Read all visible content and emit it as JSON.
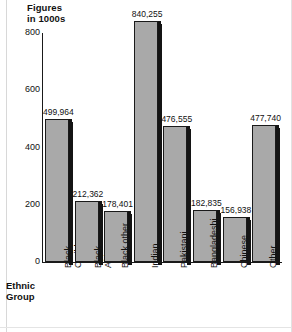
{
  "chart_data": {
    "type": "bar",
    "title": "",
    "ylabel": "Figures\nin 1000s",
    "xlabel": "Ethnic\nGroup",
    "ylim": [
      0,
      800
    ],
    "yticks": [
      0,
      200,
      400,
      600,
      800
    ],
    "grid": false,
    "legend": null,
    "categories": [
      "Black\nCaribbean",
      "Black\nAfrican",
      "Black other",
      "Indian",
      "Pakistani",
      "Bangladeshi",
      "Chinese",
      "Other"
    ],
    "values": [
      499964,
      212362,
      178401,
      840255,
      476555,
      182835,
      156938,
      477740
    ],
    "value_labels": [
      "499,964",
      "212,362",
      "178,401",
      "840,255",
      "476,555",
      "182,835",
      "156,938",
      "477,740"
    ],
    "bar_color": "#a9a9a9",
    "bar_edge_color": "#1a1a1a",
    "axis_color": "#1a1a1a",
    "background": "#ffffff"
  }
}
